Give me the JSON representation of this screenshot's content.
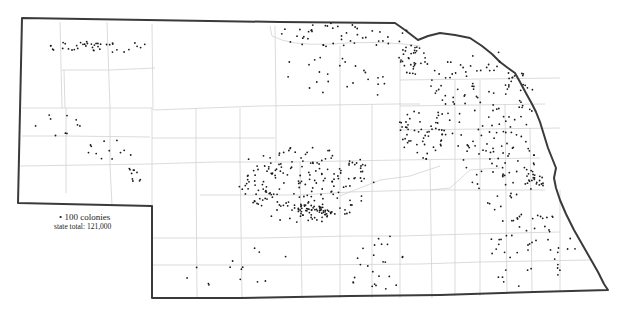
{
  "map": {
    "title": "Nebraska honey bee colonies (dot density)",
    "colors": {
      "outline": "#3a3a3a",
      "county": "#cfcfcf",
      "dot": "#1a1a1a",
      "background": "#ffffff"
    },
    "legend": {
      "dot_value": "• 100 colonies",
      "state_total": "state total: 121,000"
    },
    "dot_clusters": [
      {
        "name": "panhandle-north",
        "cx": 100,
        "cy": 47,
        "rx": 55,
        "ry": 6,
        "n": 40
      },
      {
        "name": "panhandle-diag-1",
        "cx": 60,
        "cy": 125,
        "rx": 25,
        "ry": 12,
        "n": 10
      },
      {
        "name": "panhandle-diag-2",
        "cx": 110,
        "cy": 150,
        "rx": 25,
        "ry": 10,
        "n": 12
      },
      {
        "name": "panhandle-diag-3",
        "cx": 140,
        "cy": 175,
        "rx": 20,
        "ry": 8,
        "n": 10
      },
      {
        "name": "north-border",
        "cx": 345,
        "cy": 35,
        "rx": 70,
        "ry": 12,
        "n": 45
      },
      {
        "name": "northeast-cluster",
        "cx": 413,
        "cy": 60,
        "rx": 15,
        "ry": 15,
        "n": 35
      },
      {
        "name": "north-central",
        "cx": 330,
        "cy": 80,
        "rx": 60,
        "ry": 25,
        "n": 25
      },
      {
        "name": "central-big",
        "cx": 310,
        "cy": 185,
        "rx": 65,
        "ry": 40,
        "n": 170
      },
      {
        "name": "central-core",
        "cx": 315,
        "cy": 210,
        "rx": 18,
        "ry": 10,
        "n": 50
      },
      {
        "name": "central-west",
        "cx": 260,
        "cy": 180,
        "rx": 25,
        "ry": 25,
        "n": 30
      },
      {
        "name": "east-central",
        "cx": 420,
        "cy": 135,
        "rx": 25,
        "ry": 25,
        "n": 50
      },
      {
        "name": "northeast-wide",
        "cx": 480,
        "cy": 100,
        "rx": 55,
        "ry": 55,
        "n": 120
      },
      {
        "name": "east",
        "cx": 500,
        "cy": 170,
        "rx": 40,
        "ry": 40,
        "n": 60
      },
      {
        "name": "omaha",
        "cx": 535,
        "cy": 178,
        "rx": 12,
        "ry": 12,
        "n": 20
      },
      {
        "name": "southeast",
        "cx": 530,
        "cy": 250,
        "rx": 50,
        "ry": 40,
        "n": 55
      },
      {
        "name": "south-central",
        "cx": 380,
        "cy": 262,
        "rx": 40,
        "ry": 30,
        "n": 25
      },
      {
        "name": "southwest",
        "cx": 230,
        "cy": 260,
        "rx": 60,
        "ry": 30,
        "n": 14
      }
    ]
  }
}
